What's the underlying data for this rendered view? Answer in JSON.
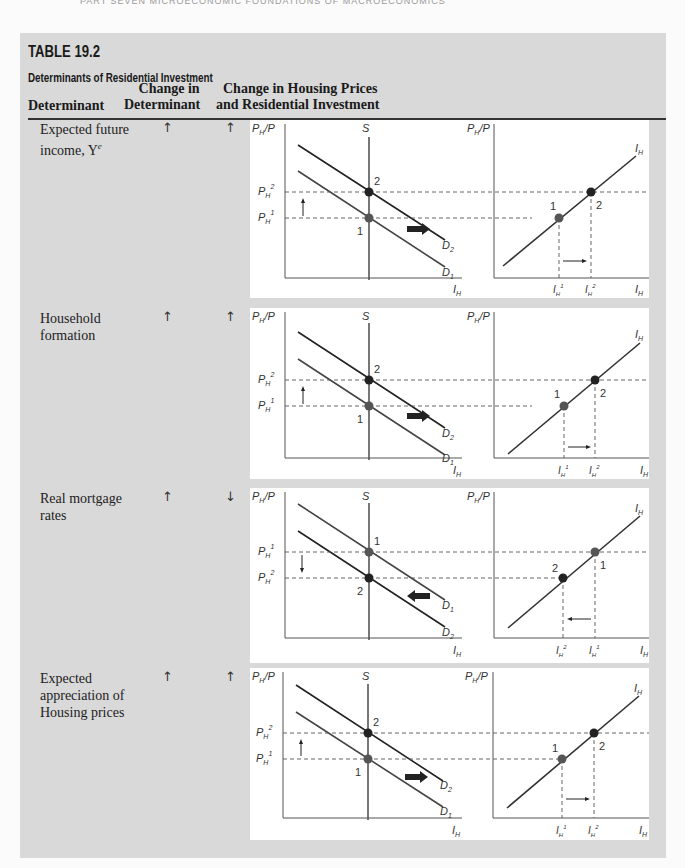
{
  "running_head": "PART SEVEN   MICROECONOMIC FOUNDATIONS OF MACROECONOMICS",
  "table": {
    "number": "TABLE 19.2",
    "title": "Determinants of Residential Investment",
    "columns": {
      "determinant": "Determinant",
      "change_line1": "Change in",
      "change_line2": "Determinant",
      "result_line1": "Change in Housing Prices",
      "result_line2": "and Residential Investment"
    },
    "rows": [
      {
        "determinant_line1": "Expected future",
        "determinant_line2": "income, Y",
        "determinant_sup": "e",
        "change": "↑",
        "result": "↑",
        "shift": "right",
        "upper_demand": "D2",
        "lower_demand": "D1"
      },
      {
        "determinant_line1": "Household",
        "determinant_line2": "formation",
        "change": "↑",
        "result": "↑",
        "shift": "right",
        "upper_demand": "D2",
        "lower_demand": "D1"
      },
      {
        "determinant_line1": "Real mortgage",
        "determinant_line2": "rates",
        "change": "↑",
        "result": "↓",
        "shift": "left",
        "upper_demand": "D1",
        "lower_demand": "D2"
      },
      {
        "determinant_line1": "Expected",
        "determinant_line2": "appreciation of",
        "determinant_line3": "Housing prices",
        "change": "↑",
        "result": "↑",
        "shift": "right",
        "upper_demand": "D2",
        "lower_demand": "D1"
      }
    ]
  },
  "diagram_labels": {
    "y_axis": "PH/P",
    "supply": "S",
    "x_axis_left": "IH",
    "x_axis_right": "IH",
    "investment_curve": "IH",
    "point1": "1",
    "point2": "2"
  }
}
